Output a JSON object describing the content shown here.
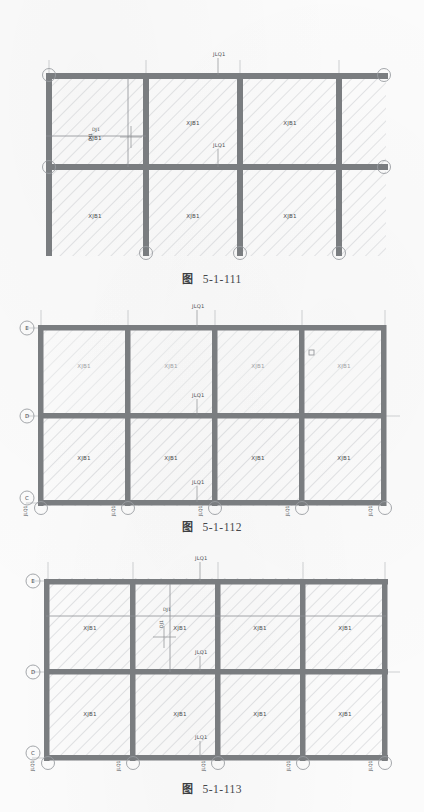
{
  "document": {
    "type": "structural-floor-plan-sheet",
    "page_background": "#fbfbfb",
    "ink_color": "#6e7174",
    "beam_color": "#7a7d80",
    "hatch_color": "#b9bcc0"
  },
  "figures": [
    {
      "id": "fig-5-1-111",
      "caption_word": "图",
      "caption_number": "5-1-111",
      "axis_labels": [
        "A",
        "B"
      ],
      "beam_labels": [
        {
          "text": "JLQ1",
          "position": "top-center"
        },
        {
          "text": "JLQ1",
          "position": "middle-center"
        }
      ],
      "detail_labels": [
        {
          "text": "DJ1"
        },
        {
          "text": "DJ1"
        }
      ],
      "slab_labels": [
        {
          "text": "XJB1",
          "row": 1,
          "col": 1
        },
        {
          "text": "XJB1",
          "row": 1,
          "col": 2
        },
        {
          "text": "XJB1",
          "row": 1,
          "col": 3
        },
        {
          "text": "XJB1",
          "row": 2,
          "col": 1
        },
        {
          "text": "XJB1",
          "row": 2,
          "col": 2
        },
        {
          "text": "XJB1",
          "row": 2,
          "col": 3
        }
      ],
      "columns": 4,
      "rows": 2
    },
    {
      "id": "fig-5-1-112",
      "caption_word": "图",
      "caption_number": "5-1-112",
      "axis_labels": [
        "E",
        "D",
        "C"
      ],
      "beam_labels": [
        {
          "text": "JLQ1",
          "position": "top-center"
        },
        {
          "text": "JLQ1",
          "position": "middle-center"
        },
        {
          "text": "JLQ1",
          "position": "lower-center"
        }
      ],
      "bottom_labels": [
        "JLQ1",
        "JLQ1",
        "JLQ1",
        "JLQ1",
        "JLQ1"
      ],
      "slab_labels_upper": [
        "XJB1",
        "XJB1",
        "XJB1",
        "XJB1"
      ],
      "slab_labels_lower": [
        "XJB1",
        "XJB1",
        "XJB1",
        "XJB1"
      ],
      "columns": 5,
      "rows": 2
    },
    {
      "id": "fig-5-1-113",
      "caption_word": "图",
      "caption_number": "5-1-113",
      "axis_labels": [
        "E",
        "D",
        "C"
      ],
      "beam_labels": [
        {
          "text": "JLQ1",
          "position": "top-center"
        },
        {
          "text": "JLQ1",
          "position": "middle-center"
        },
        {
          "text": "JLQ1",
          "position": "lower-center"
        }
      ],
      "detail_labels": [
        {
          "text": "DJ1"
        },
        {
          "text": "DJ1"
        }
      ],
      "bottom_labels": [
        "JLQ1",
        "JLQ1",
        "JLQ1",
        "JLQ1",
        "JLQ1"
      ],
      "slab_labels_upper": [
        "XJB1",
        "XJB1",
        "XJB1",
        "XJB1"
      ],
      "slab_labels_lower": [
        "XJB1",
        "XJB1",
        "XJB1",
        "XJB1"
      ],
      "columns": 5,
      "rows": 2
    }
  ]
}
